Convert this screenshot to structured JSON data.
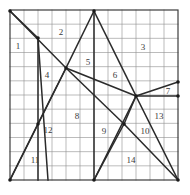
{
  "figure": {
    "kind": "partitioned-square-diagram",
    "canvas": {
      "width": 190,
      "height": 195
    },
    "grid": {
      "x0": 10,
      "y0": 10,
      "x1": 178,
      "y1": 180,
      "columns": 12,
      "rows": 12,
      "grid_color": "#8e8e8e",
      "border_color": "#3d3d3d",
      "grid_line_width": 0.6,
      "border_line_width": 1.2
    },
    "partition_lines": {
      "color": "#2b2b2b",
      "line_width": 1.5,
      "vertex_dot_color": "#1a1a1a",
      "segments": [
        {
          "name": "tl-to-center",
          "x1": 10,
          "y1": 11,
          "x2": 66,
          "y2": 68
        },
        {
          "name": "center-to-bl",
          "x1": 66,
          "y1": 68,
          "x2": 10,
          "y2": 180
        },
        {
          "name": "tl-steep-to-bottom",
          "x1": 38,
          "y1": 38,
          "x2": 38,
          "y2": 180
        },
        {
          "name": "tl-steep-edge",
          "x1": 10,
          "y1": 11,
          "x2": 38,
          "y2": 38
        },
        {
          "name": "upper-left-fan",
          "x1": 38,
          "y1": 38,
          "x2": 48,
          "y2": 180
        },
        {
          "name": "apex-to-center",
          "x1": 94,
          "y1": 11,
          "x2": 66,
          "y2": 68
        },
        {
          "name": "center-to-lower",
          "x1": 66,
          "y1": 68,
          "x2": 10,
          "y2": 180
        },
        {
          "name": "apex-right-descend",
          "x1": 94,
          "y1": 11,
          "x2": 136,
          "y2": 96
        },
        {
          "name": "apex-vertical",
          "x1": 94,
          "y1": 11,
          "x2": 94,
          "y2": 180
        },
        {
          "name": "center-to-right-vertex",
          "x1": 66,
          "y1": 68,
          "x2": 136,
          "y2": 96
        },
        {
          "name": "right-vertex-to-edge-up",
          "x1": 136,
          "y1": 96,
          "x2": 178,
          "y2": 82
        },
        {
          "name": "right-vertex-horizontal",
          "x1": 136,
          "y1": 96,
          "x2": 178,
          "y2": 96
        },
        {
          "name": "right-vertex-to-br",
          "x1": 136,
          "y1": 96,
          "x2": 178,
          "y2": 180
        },
        {
          "name": "right-vertex-to-lower-center",
          "x1": 136,
          "y1": 96,
          "x2": 124,
          "y2": 124
        },
        {
          "name": "lower-center-to-br",
          "x1": 124,
          "y1": 124,
          "x2": 178,
          "y2": 180
        },
        {
          "name": "lower-center-to-bottom-apex",
          "x1": 124,
          "y1": 124,
          "x2": 94,
          "y2": 180
        },
        {
          "name": "center-through-lower-center",
          "x1": 66,
          "y1": 68,
          "x2": 124,
          "y2": 124
        },
        {
          "name": "bottom-apex-up-right",
          "x1": 94,
          "y1": 180,
          "x2": 136,
          "y2": 96
        }
      ],
      "vertices": [
        {
          "name": "top-left-corner",
          "x": 10,
          "y": 11
        },
        {
          "name": "top-apex",
          "x": 94,
          "y": 11
        },
        {
          "name": "center-vertex",
          "x": 66,
          "y": 68
        },
        {
          "name": "right-vertex",
          "x": 136,
          "y": 96
        },
        {
          "name": "right-edge-upper",
          "x": 178,
          "y": 82
        },
        {
          "name": "right-edge-mid",
          "x": 178,
          "y": 96
        },
        {
          "name": "lower-center-vertex",
          "x": 124,
          "y": 124
        },
        {
          "name": "left-upper-node",
          "x": 38,
          "y": 38
        },
        {
          "name": "left-mid-node",
          "x": 38,
          "y": 124
        },
        {
          "name": "bottom-left-corner",
          "x": 10,
          "y": 180
        },
        {
          "name": "bottom-apex",
          "x": 94,
          "y": 180
        },
        {
          "name": "bottom-right-corner",
          "x": 178,
          "y": 180
        }
      ]
    },
    "region_labels": [
      {
        "id": "region-1",
        "text": "1",
        "x": 18,
        "y": 46
      },
      {
        "id": "region-2",
        "text": "2",
        "x": 61,
        "y": 32
      },
      {
        "id": "region-3",
        "text": "3",
        "x": 143,
        "y": 47
      },
      {
        "id": "region-4",
        "text": "4",
        "x": 47,
        "y": 75
      },
      {
        "id": "region-5",
        "text": "5",
        "x": 88,
        "y": 62
      },
      {
        "id": "region-6",
        "text": "6",
        "x": 115,
        "y": 75
      },
      {
        "id": "region-7",
        "text": "7",
        "x": 168,
        "y": 91
      },
      {
        "id": "region-8",
        "text": "8",
        "x": 77,
        "y": 116
      },
      {
        "id": "region-9",
        "text": "9",
        "x": 104,
        "y": 131
      },
      {
        "id": "region-10",
        "text": "10",
        "x": 145,
        "y": 131
      },
      {
        "id": "region-11",
        "text": "11",
        "x": 35,
        "y": 160
      },
      {
        "id": "region-12",
        "text": "12",
        "x": 48,
        "y": 130
      },
      {
        "id": "region-13",
        "text": "13",
        "x": 159,
        "y": 116
      },
      {
        "id": "region-14",
        "text": "14",
        "x": 131,
        "y": 160
      }
    ]
  }
}
